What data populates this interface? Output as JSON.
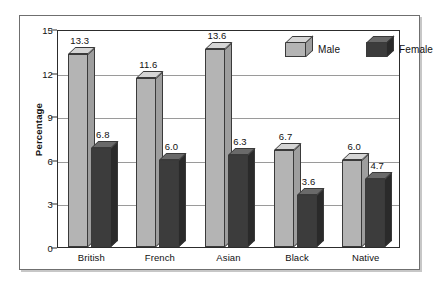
{
  "chart_data": {
    "type": "bar",
    "title": "",
    "xlabel": "",
    "ylabel": "Percentage",
    "categories": [
      "British",
      "French",
      "Asian",
      "Black",
      "Native"
    ],
    "series": [
      {
        "name": "Male",
        "values": [
          13.3,
          11.6,
          13.6,
          6.7,
          6.0
        ],
        "color": "#b4b4b4"
      },
      {
        "name": "Female",
        "values": [
          6.8,
          6.0,
          6.3,
          3.6,
          4.7
        ],
        "color": "#3c3c3c"
      }
    ],
    "ylim": [
      0,
      15
    ],
    "yticks": [
      0,
      3,
      6,
      9,
      12,
      15
    ],
    "ytick_labels": [
      "0",
      "3",
      "6",
      "9",
      "12",
      "15"
    ],
    "grid": true,
    "grid_axis": "y",
    "legend_position": "top-right",
    "data_labels": true,
    "style": "3d-grouped-bar"
  },
  "legend": {
    "items": [
      {
        "label": "Male",
        "swatch": "cube-3d-light"
      },
      {
        "label": "Female",
        "swatch": "cube-3d-dark"
      }
    ]
  },
  "axes": {
    "y_title": "Percentage",
    "y_ticks": [
      "15",
      "12",
      "9",
      "6",
      "3",
      "0"
    ],
    "x_ticks": [
      "British",
      "French",
      "Asian",
      "Black",
      "Native"
    ]
  },
  "data_labels": {
    "male": [
      "13.3",
      "11.6",
      "13.6",
      "6.7",
      "6.0"
    ],
    "female": [
      "6.8",
      "6.0",
      "6.3",
      "3.6",
      "4.7"
    ]
  },
  "colors": {
    "male_front": "#b4b4b4",
    "male_top": "#d5d5d5",
    "male_side": "#9e9e9e",
    "female_front": "#3c3c3c",
    "female_top": "#6a6a6a",
    "female_side": "#2a2a2a",
    "grid": "#9a9a9a",
    "frame": "#2c2c2c",
    "background": "#ffffff"
  }
}
